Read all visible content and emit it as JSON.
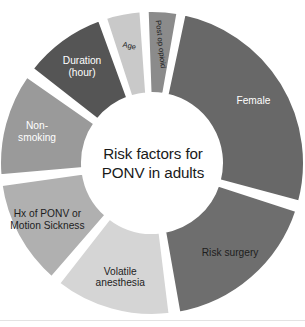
{
  "figure": {
    "title_lines": [
      "Risk factors for",
      "PONV in adults"
    ],
    "background_color": "#ffffff",
    "separator_color": "#ffffff",
    "baseline_rule_color": "#e3e3e3"
  },
  "chart_data": {
    "type": "pie",
    "variant": "donut",
    "title": "Risk factors for PONV in adults",
    "center_label_lines": [
      "Risk factors for",
      "PONV in adults"
    ],
    "legend": "none",
    "grid": false,
    "labels_inside_slices": true,
    "categories": [
      "Female",
      "Risk surgery",
      "Volatile anesthesia",
      "Hx of PONV or Motion Sickness",
      "Non-smoking",
      "Duration (hour)",
      "Age",
      "Post op opioid"
    ],
    "values": [
      26,
      17,
      12.5,
      11.5,
      11,
      9,
      7,
      6
    ],
    "value_unit": "percent",
    "slices": [
      {
        "label": "Female",
        "label_lines": [
          "Female"
        ],
        "value": 26,
        "start_angle": 12,
        "end_angle": 105,
        "color": "#686868",
        "text_color": "#ffffff",
        "text_rotation": 0
      },
      {
        "label": "Risk surgery",
        "label_lines": [
          "Risk surgery"
        ],
        "value": 17,
        "start_angle": 108,
        "end_angle": 170,
        "color": "#6e6e6e",
        "text_color": "#1d1d1d",
        "text_rotation": 0
      },
      {
        "label": "Volatile anesthesia",
        "label_lines": [
          "Volatile",
          "anesthesia"
        ],
        "value": 12.5,
        "start_angle": 173,
        "end_angle": 218,
        "color": "#d5d5d5",
        "text_color": "#1d1d1d",
        "text_rotation": 0
      },
      {
        "label": "Hx of PONV or Motion Sickness",
        "label_lines": [
          "Hx of PONV or",
          "Motion Sickness"
        ],
        "value": 11.5,
        "start_angle": 221,
        "end_angle": 262,
        "color": "#b0b0b0",
        "text_color": "#1d1d1d",
        "text_rotation": 0
      },
      {
        "label": "Non-smoking",
        "label_lines": [
          "Non-",
          "smoking"
        ],
        "value": 11,
        "start_angle": 265,
        "end_angle": 305,
        "color": "#9a9a9a",
        "text_color": "#ffffff",
        "text_rotation": 0
      },
      {
        "label": "Duration (hour)",
        "label_lines": [
          "Duration",
          "(hour)"
        ],
        "value": 9,
        "start_angle": 308,
        "end_angle": 340,
        "color": "#555555",
        "text_color": "#ffffff",
        "text_rotation": 0
      },
      {
        "label": "Age",
        "label_lines": [
          "Age"
        ],
        "value": 7,
        "start_angle": 342,
        "end_angle": 356,
        "color": "#c9c9c9",
        "text_color": "#1d1d1d",
        "text_rotation": -12
      },
      {
        "label": "Post op opioid",
        "label_lines": [
          "Post op opioid"
        ],
        "value": 6,
        "start_angle": 358,
        "end_angle": 370,
        "color": "#8b8b8b",
        "text_color": "#1d1d1d",
        "text_rotation": -84
      }
    ]
  }
}
